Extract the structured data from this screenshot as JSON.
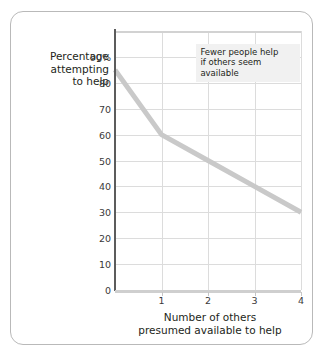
{
  "chart_data": {
    "type": "line",
    "title": "",
    "xlabel": "Number of others presumed available to help",
    "ylabel": "Percentage attempting to help",
    "xlabel_lines": [
      "Number of others",
      "presumed available to help"
    ],
    "ylabel_lines": [
      "Percentage",
      "attempting",
      "to help"
    ],
    "x": [
      0,
      1,
      2,
      3,
      4
    ],
    "values": [
      85,
      60,
      50,
      40,
      30
    ],
    "series": [
      {
        "name": "Percentage attempting to help",
        "values": [
          85,
          60,
          50,
          40,
          30
        ],
        "color": "#c9c9c9"
      }
    ],
    "xlim": [
      0,
      4
    ],
    "ylim": [
      0,
      100
    ],
    "xticks": [
      1,
      2,
      3,
      4
    ],
    "xtick_labels": [
      "1",
      "2",
      "3",
      "4"
    ],
    "yticks": [
      0,
      10,
      20,
      30,
      40,
      50,
      60,
      70,
      80,
      90
    ],
    "ytick_labels": [
      "0",
      "10",
      "20",
      "30",
      "40",
      "50",
      "60",
      "70",
      "80",
      "90%"
    ],
    "grid": true,
    "legend": "none",
    "annotations": [
      {
        "lines": [
          "Fewer people help",
          "if others seem",
          "available"
        ],
        "text": "Fewer people help if others seem available",
        "x": 1.75,
        "y": 95
      }
    ],
    "colors": {
      "line": "#c9c9c9",
      "grid": "#dcdcdc",
      "y_axis": "#5c5c5c",
      "x_axis": "#cfcfcf",
      "card_border": "#b9b9b9",
      "annotation_background": "#f1f1f1",
      "text": "#231f20",
      "tick_text": "#3a3a3a"
    }
  }
}
